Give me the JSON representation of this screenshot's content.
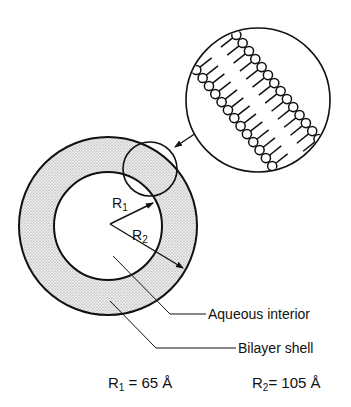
{
  "diagram": {
    "labels": {
      "r1_arrow": "R",
      "r1_sub": "1",
      "r2_arrow": "R",
      "r2_sub": "2",
      "aqueous_interior": "Aqueous interior",
      "bilayer_shell": "Bilayer shell"
    },
    "values": {
      "r1_prefix": "R",
      "r1_sub": "1",
      "r1_eq": " = 65 Å",
      "r2_prefix": "R",
      "r2_sub": "2",
      "r2_eq": "= 105 Å"
    },
    "colors": {
      "line": "#111111",
      "shell_fill": "#d9d9d9",
      "background": "#ffffff"
    }
  }
}
